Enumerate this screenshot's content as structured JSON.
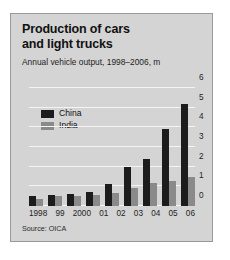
{
  "figure": {
    "title_lines": [
      "Production of cars",
      "and light trucks"
    ],
    "subtitle": "Annual vehicle output, 1998–2006, m",
    "source": "Source: OICA"
  },
  "legend": {
    "items": [
      {
        "label": "China",
        "color": "#1c1c1c"
      },
      {
        "label": "India",
        "color": "#8a8a8a"
      }
    ]
  },
  "colors": {
    "card_background": "#d4d4d4",
    "card_border": "#9a9a9a",
    "gridline": "#f4f4f4",
    "china": "#1c1c1c",
    "india": "#8a8a8a",
    "text": "#111111"
  },
  "chart_data": {
    "type": "bar",
    "title": "Production of cars and light trucks",
    "subtitle": "Annual vehicle output, 1998–2006, m",
    "xlabel": "",
    "ylabel": "",
    "ylim": [
      0,
      6
    ],
    "yticks": [
      0,
      1,
      2,
      3,
      4,
      5,
      6
    ],
    "ytick_labels": [
      "0",
      "1",
      "2",
      "3",
      "4",
      "5",
      "6"
    ],
    "grid": true,
    "legend_position": "upper-left",
    "units": "millions of vehicles",
    "categories": [
      "1998",
      "99",
      "2000",
      "01",
      "02",
      "03",
      "04",
      "05",
      "06"
    ],
    "series": [
      {
        "name": "China",
        "color": "#1c1c1c",
        "values": [
          0.5,
          0.55,
          0.6,
          0.7,
          1.1,
          2.0,
          2.4,
          3.9,
          5.2
        ]
      },
      {
        "name": "India",
        "color": "#8a8a8a",
        "values": [
          0.35,
          0.5,
          0.5,
          0.55,
          0.65,
          0.9,
          1.15,
          1.25,
          1.5
        ]
      }
    ],
    "source": "Source: OICA"
  }
}
